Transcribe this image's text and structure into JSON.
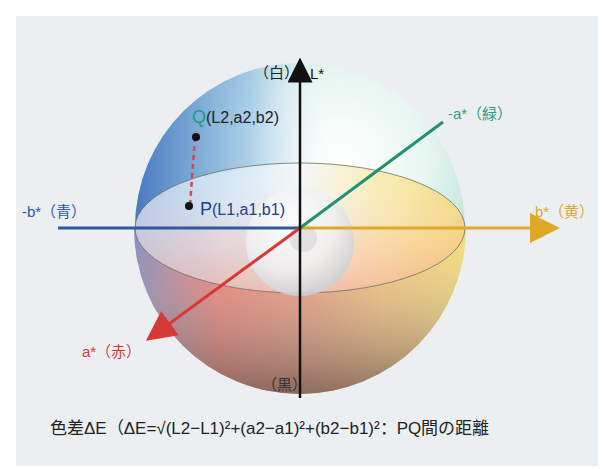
{
  "axes": {
    "L": {
      "label": "L*",
      "top_label": "（白）",
      "bottom_label": "（黒）",
      "color": "#111111"
    },
    "minus_a": {
      "label": "-a*（緑）",
      "color": "#2f9a84"
    },
    "a": {
      "label": "a*（赤）",
      "color": "#d63a36"
    },
    "b": {
      "label": "b*（黄）",
      "color": "#e0a828"
    },
    "minus_b": {
      "label": "-b*（青）",
      "color": "#2c5aa0"
    }
  },
  "points": {
    "Q": {
      "name": "Q",
      "coords": "(L2,a2,b2)"
    },
    "P": {
      "name": "P",
      "coords": "(L1,a1,b1)"
    }
  },
  "formula": {
    "text": "色差ΔE（ΔE=√(L2−L1)²+(a2−a1)²+(b2−b1)²：PQ間の距離"
  }
}
